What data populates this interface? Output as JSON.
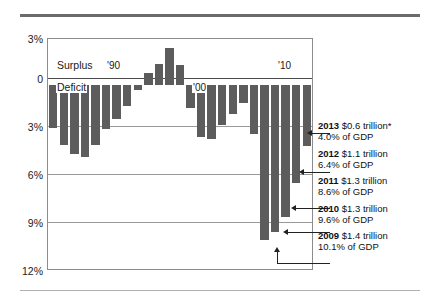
{
  "chart_data": {
    "type": "bar",
    "title": "",
    "xlabel": "",
    "ylabel": "",
    "ylim": [
      -12,
      3
    ],
    "grid": true,
    "ytick_labels": [
      "3%",
      "0",
      "3%",
      "6%",
      "9%",
      "12%"
    ],
    "ytick_values": [
      3,
      0,
      -3,
      -6,
      -9,
      -12
    ],
    "axis_note": "Values below zero are deficits (shown as positive percent labels)",
    "inline_labels": [
      {
        "text": "Surplus",
        "position": "above-zero-left"
      },
      {
        "text": "Deficit",
        "position": "below-zero-left"
      },
      {
        "text": "'90",
        "position": "x-1990"
      },
      {
        "text": "'00",
        "position": "x-2000"
      },
      {
        "text": "'10",
        "position": "x-2010"
      }
    ],
    "categories": [
      "1989",
      "1990",
      "1991",
      "1992",
      "1993",
      "1994",
      "1995",
      "1996",
      "1997",
      "1998",
      "1999",
      "2000",
      "2001",
      "2002",
      "2003",
      "2004",
      "2005",
      "2006",
      "2007",
      "2008",
      "2009",
      "2010",
      "2011",
      "2012",
      "2013"
    ],
    "values": [
      -2.8,
      -3.9,
      -4.5,
      -4.7,
      -3.9,
      -2.9,
      -2.2,
      -1.4,
      -0.3,
      0.8,
      1.4,
      2.4,
      1.3,
      -1.5,
      -3.4,
      -3.5,
      -2.6,
      -1.9,
      -1.2,
      -3.2,
      -10.1,
      -9.6,
      -8.6,
      -6.4,
      -4.0
    ],
    "series_name": "Federal surplus/deficit as % of GDP",
    "annotations": [
      {
        "year": "2013",
        "amount": "$0.6 trillion",
        "asterisk": true,
        "gdp": "4.0% of GDP"
      },
      {
        "year": "2012",
        "amount": "$1.1 trillion",
        "asterisk": false,
        "gdp": "6.4% of GDP"
      },
      {
        "year": "2011",
        "amount": "$1.3 trillion",
        "asterisk": false,
        "gdp": "8.6% of GDP"
      },
      {
        "year": "2010",
        "amount": "$1.3 trillion",
        "asterisk": false,
        "gdp": "9.6% of GDP"
      },
      {
        "year": "2009",
        "amount": "$1.4 trillion",
        "asterisk": false,
        "gdp": "10.1% of GDP"
      }
    ],
    "colors": {
      "bar": "#5c5c5c",
      "grid": "#9a9a9a",
      "rule": "#6b6b6b",
      "text": "#1a1a1a"
    }
  }
}
